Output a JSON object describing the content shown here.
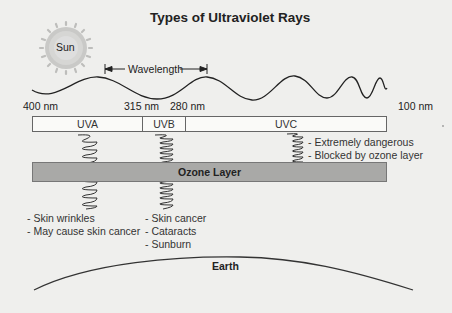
{
  "title": "Types of Ultraviolet Rays",
  "sun": {
    "label": "Sun",
    "icon": "sun-icon"
  },
  "wavelength": {
    "label": "Wavelength"
  },
  "scale": {
    "start": "400 nm",
    "uva_uvb": "315 nm",
    "uvb_uvc": "280 nm",
    "end": "100 nm"
  },
  "bands": [
    {
      "name": "UVA",
      "notes": [
        "- Skin wrinkles",
        "- May cause skin cancer"
      ]
    },
    {
      "name": "UVB",
      "notes": [
        "- Skin cancer",
        "- Cataracts",
        "- Sunburn"
      ]
    },
    {
      "name": "UVC",
      "notes": [
        "- Extremely dangerous",
        "- Blocked by ozone layer"
      ]
    }
  ],
  "ozone": {
    "label": "Ozone Layer",
    "color": "#a9a9a7"
  },
  "earth": {
    "label": "Earth"
  }
}
